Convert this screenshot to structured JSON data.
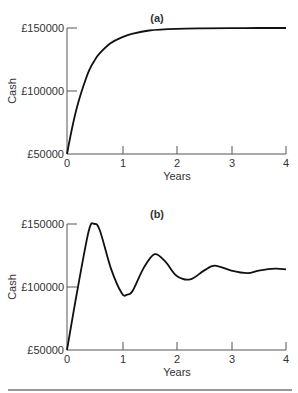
{
  "chart_data": [
    {
      "type": "line",
      "title": "(a)",
      "xlabel": "Years",
      "ylabel": "Cash",
      "xlim": [
        0,
        4
      ],
      "ylim": [
        50000,
        150000
      ],
      "x_ticks": [
        "0",
        "1",
        "2",
        "3",
        "4"
      ],
      "y_ticks": [
        "£50000",
        "£100000",
        "£150000"
      ],
      "grid": false,
      "series": [
        {
          "name": "Cash",
          "x": [
            0,
            0.1,
            0.2,
            0.3,
            0.4,
            0.5,
            0.6,
            0.8,
            1.0,
            1.2,
            1.5,
            2.0,
            2.5,
            3.0,
            3.5,
            4.0
          ],
          "values": [
            50000,
            72000,
            90000,
            104000,
            116000,
            124000,
            130000,
            138000,
            142500,
            145500,
            148000,
            149300,
            149700,
            149900,
            150000,
            150000
          ]
        }
      ]
    },
    {
      "type": "line",
      "title": "(b)",
      "xlabel": "Years",
      "ylabel": "Cash",
      "xlim": [
        0,
        4
      ],
      "ylim": [
        50000,
        150000
      ],
      "x_ticks": [
        "0",
        "1",
        "2",
        "3",
        "4"
      ],
      "y_ticks": [
        "£50000",
        "£100000",
        "£150000"
      ],
      "grid": false,
      "series": [
        {
          "name": "Cash",
          "x": [
            0,
            0.2,
            0.4,
            0.5,
            0.6,
            0.8,
            1.0,
            1.1,
            1.2,
            1.4,
            1.6,
            1.8,
            2.0,
            2.25,
            2.5,
            2.7,
            3.0,
            3.3,
            3.5,
            3.8,
            4.0
          ],
          "values": [
            50000,
            100000,
            145000,
            150000,
            145000,
            115000,
            95000,
            94000,
            97000,
            115000,
            126000,
            120000,
            109000,
            106000,
            113000,
            117000,
            113000,
            111000,
            113000,
            114500,
            114000
          ]
        }
      ]
    }
  ],
  "labels": {
    "a": {
      "title": "(a)",
      "xlabel": "Years",
      "ylabel": "Cash",
      "y150": "£150000",
      "y100": "£100000",
      "y50": "£50000",
      "x0": "0",
      "x1": "1",
      "x2": "2",
      "x3": "3",
      "x4": "4"
    },
    "b": {
      "title": "(b)",
      "xlabel": "Years",
      "ylabel": "Cash",
      "y150": "£150000",
      "y100": "£100000",
      "y50": "£50000",
      "x0": "0",
      "x1": "1",
      "x2": "2",
      "x3": "3",
      "x4": "4"
    }
  }
}
